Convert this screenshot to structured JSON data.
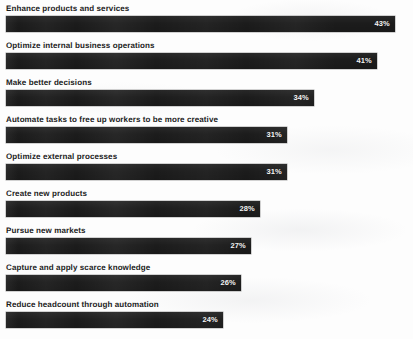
{
  "chart_data": {
    "type": "bar",
    "orientation": "horizontal",
    "title": "",
    "subtitle": "",
    "xlabel": "",
    "ylabel": "",
    "grid": false,
    "legend": false,
    "legend_position": "none",
    "axis_visible": false,
    "xlim": [
      0,
      43.5
    ],
    "value_suffix": "%",
    "bar_color": "#1c1c1c",
    "value_label_color": "#f2f2f2",
    "label_color": "#1b1b1b",
    "background_color": "#fdfdfd",
    "categories": [
      "Enhance products and services",
      "Optimize internal business operations",
      "Make better decisions",
      "Automate tasks to free up workers to be more creative",
      "Optimize external processes",
      "Create new products",
      "Pursue new markets",
      "Capture and apply scarce knowledge",
      "Reduce headcount through automation"
    ],
    "values": [
      43,
      41,
      34,
      31,
      31,
      28,
      27,
      26,
      24
    ],
    "value_labels": [
      "43%",
      "41%",
      "34%",
      "31%",
      "31%",
      "28%",
      "27%",
      "26%",
      "24%"
    ]
  }
}
